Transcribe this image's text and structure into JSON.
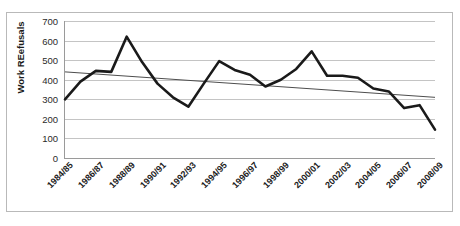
{
  "chart_data": {
    "type": "line",
    "title": "",
    "xlabel": "",
    "ylabel": "Work REefusals",
    "ylim": [
      0,
      700
    ],
    "ytick_values": [
      700,
      600,
      500,
      400,
      300,
      200,
      100,
      0
    ],
    "ytick_labels": [
      "700",
      "600",
      "500",
      "400",
      "300",
      "200",
      "100",
      "0"
    ],
    "grid": true,
    "legend": "none",
    "x": [
      "1984/85",
      "1985/86",
      "1986/87",
      "1987/88",
      "1988/89",
      "1989/90",
      "1990/91",
      "1991/92",
      "1992/93",
      "1993/94",
      "1994/95",
      "1995/96",
      "1996/97",
      "1997/98",
      "1998/99",
      "1999/00",
      "2000/01",
      "2001/02",
      "2002/03",
      "2003/04",
      "2004/05",
      "2005/06",
      "2006/07",
      "2007/08",
      "2008/09"
    ],
    "xtick_labels": [
      "1984/85",
      "1986/87",
      "1988/89",
      "1990/91",
      "1992/93",
      "1994/95",
      "1996/97",
      "1998/99",
      "2000/01",
      "2002/03",
      "2004/05",
      "2006/07",
      "2008/09"
    ],
    "series": [
      {
        "name": "Work refusals",
        "values": [
          300,
          390,
          445,
          440,
          620,
          490,
          380,
          310,
          262,
          380,
          495,
          450,
          425,
          365,
          400,
          455,
          545,
          420,
          420,
          410,
          355,
          340,
          255,
          270,
          145
        ]
      }
    ],
    "trendline": {
      "name": "Linear trend",
      "start_value": 440,
      "end_value": 310
    },
    "colors": {
      "series_line": "#1a1a1a",
      "trendline": "#4d4d4d",
      "gridline": "#c4c4c4",
      "axis": "#9a9a9a",
      "frame": "#b9b9b9",
      "text": "#1b1b1b",
      "background": "#ffffff"
    }
  }
}
